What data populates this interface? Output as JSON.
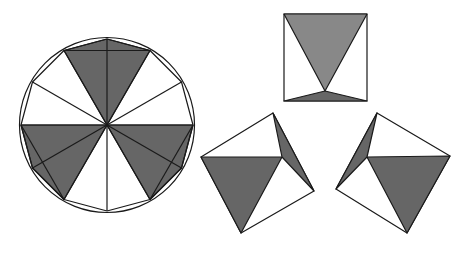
{
  "diagram": {
    "colors": {
      "background": "#ffffff",
      "stroke": "#1a1a1a",
      "shade_dark": "#666666",
      "shade_light": "#888888",
      "fill_white": "#ffffff"
    },
    "circle": {
      "cx": 107,
      "cy": 125,
      "r": 87,
      "dodecagon_r": 86
    },
    "square_top": {
      "corners": [
        [
          284,
          14
        ],
        [
          367,
          14
        ],
        [
          367,
          101
        ],
        [
          284,
          101
        ]
      ],
      "apex": [
        325,
        91
      ]
    },
    "square_left": {
      "corners": [
        [
          273,
          113
        ],
        [
          314,
          191
        ],
        [
          241,
          233
        ],
        [
          201,
          157
        ]
      ],
      "inner": [
        282,
        157
      ]
    },
    "square_right": {
      "corners": [
        [
          377,
          113
        ],
        [
          450,
          156
        ],
        [
          407,
          233
        ],
        [
          336,
          189
        ]
      ],
      "inner": [
        367,
        157
      ]
    }
  }
}
